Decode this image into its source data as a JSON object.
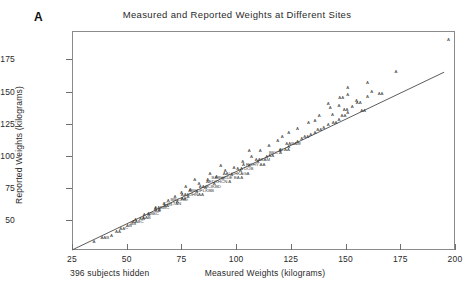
{
  "panel": {
    "label": "A"
  },
  "axes": {
    "ylabel": "Reported Weights (kilograms)",
    "xlabel": "Measured  Weights (kilograms)",
    "yticks": [
      "50",
      "75",
      "100",
      "125",
      "150",
      "175"
    ],
    "xticks": [
      "25",
      "50",
      "75",
      "100",
      "125",
      "150",
      "175",
      "200"
    ]
  },
  "footnote": {
    "text": "396 subjects hidden"
  },
  "chart_data": {
    "type": "scatter",
    "title": "Measured and Reported Weights at Different Sites",
    "xlabel": "Measured  Weights (kilograms)",
    "ylabel": "Reported Weights (kilograms)",
    "xlim": [
      25,
      200
    ],
    "ylim": [
      27,
      197
    ],
    "grid": false,
    "legend": null,
    "marker_symbol": "A",
    "marker_note": "Overplot letter codes: A = 1 observation, B = 2, C = 3",
    "reference_line": {
      "label": "fitted line",
      "x": [
        25,
        195
      ],
      "y": [
        27,
        165
      ]
    },
    "points": [
      {
        "x": 35,
        "y": 33,
        "m": "A"
      },
      {
        "x": 40,
        "y": 36,
        "m": "AAB"
      },
      {
        "x": 43,
        "y": 38,
        "m": "A"
      },
      {
        "x": 46,
        "y": 41,
        "m": "AA"
      },
      {
        "x": 48,
        "y": 43,
        "m": "AA"
      },
      {
        "x": 50,
        "y": 44,
        "m": "C"
      },
      {
        "x": 51,
        "y": 46,
        "m": "AB"
      },
      {
        "x": 53,
        "y": 47,
        "m": "BB"
      },
      {
        "x": 55,
        "y": 49,
        "m": "AABC"
      },
      {
        "x": 57,
        "y": 51,
        "m": "AA"
      },
      {
        "x": 59,
        "y": 52,
        "m": "AAB"
      },
      {
        "x": 60,
        "y": 54,
        "m": "A"
      },
      {
        "x": 62,
        "y": 55,
        "m": "ABBC"
      },
      {
        "x": 64,
        "y": 57,
        "m": "AA"
      },
      {
        "x": 65,
        "y": 58,
        "m": "A"
      },
      {
        "x": 66,
        "y": 60,
        "m": "AABBC"
      },
      {
        "x": 68,
        "y": 61,
        "m": "AA"
      },
      {
        "x": 70,
        "y": 62,
        "m": "C"
      },
      {
        "x": 71,
        "y": 63,
        "m": "COLTAN"
      },
      {
        "x": 73,
        "y": 64,
        "m": "A"
      },
      {
        "x": 74,
        "y": 66,
        "m": "BBCJND"
      },
      {
        "x": 76,
        "y": 67,
        "m": "AA"
      },
      {
        "x": 78,
        "y": 68,
        "m": "A"
      },
      {
        "x": 80,
        "y": 70,
        "m": "AABJHNAA"
      },
      {
        "x": 82,
        "y": 72,
        "m": "A"
      },
      {
        "x": 84,
        "y": 73,
        "m": "ABKDFLKBB"
      },
      {
        "x": 86,
        "y": 75,
        "m": "A"
      },
      {
        "x": 88,
        "y": 76,
        "m": "AAJKJKBD"
      },
      {
        "x": 90,
        "y": 78,
        "m": "A"
      },
      {
        "x": 92,
        "y": 80,
        "m": "AEDXHCN A"
      },
      {
        "x": 94,
        "y": 82,
        "m": "B"
      },
      {
        "x": 96,
        "y": 83,
        "m": "BABHKDE  BA  A"
      },
      {
        "x": 98,
        "y": 85,
        "m": "A"
      },
      {
        "x": 100,
        "y": 86,
        "m": "AALCHKAGA"
      },
      {
        "x": 102,
        "y": 88,
        "m": "A"
      },
      {
        "x": 104,
        "y": 90,
        "m": "A  A    DOB"
      },
      {
        "x": 106,
        "y": 92,
        "m": "A"
      },
      {
        "x": 108,
        "y": 93,
        "m": "A   RGHY  AA"
      },
      {
        "x": 110,
        "y": 95,
        "m": "A"
      },
      {
        "x": 112,
        "y": 97,
        "m": "AABAM"
      },
      {
        "x": 114,
        "y": 99,
        "m": "A"
      },
      {
        "x": 116,
        "y": 100,
        "m": "AA"
      },
      {
        "x": 118,
        "y": 102,
        "m": "BKC A"
      },
      {
        "x": 120,
        "y": 104,
        "m": "A"
      },
      {
        "x": 122,
        "y": 105,
        "m": "ALAA"
      },
      {
        "x": 124,
        "y": 107,
        "m": "A"
      },
      {
        "x": 126,
        "y": 109,
        "m": "AABAM"
      },
      {
        "x": 128,
        "y": 111,
        "m": "A"
      },
      {
        "x": 130,
        "y": 113,
        "m": "A"
      },
      {
        "x": 132,
        "y": 115,
        "m": "AA"
      },
      {
        "x": 134,
        "y": 116,
        "m": "A"
      },
      {
        "x": 136,
        "y": 118,
        "m": "A"
      },
      {
        "x": 138,
        "y": 120,
        "m": "AA"
      },
      {
        "x": 140,
        "y": 122,
        "m": "A"
      },
      {
        "x": 142,
        "y": 124,
        "m": "A"
      },
      {
        "x": 145,
        "y": 126,
        "m": "AA"
      },
      {
        "x": 147,
        "y": 128,
        "m": "A"
      },
      {
        "x": 149,
        "y": 131,
        "m": "AA"
      },
      {
        "x": 151,
        "y": 133,
        "m": "A"
      },
      {
        "x": 143,
        "y": 137,
        "m": "A"
      },
      {
        "x": 147,
        "y": 139,
        "m": "A"
      },
      {
        "x": 150,
        "y": 136,
        "m": "AA"
      },
      {
        "x": 153,
        "y": 138,
        "m": "A"
      },
      {
        "x": 156,
        "y": 141,
        "m": "AA"
      },
      {
        "x": 158,
        "y": 135,
        "m": "AA"
      },
      {
        "x": 160,
        "y": 146,
        "m": "A"
      },
      {
        "x": 138,
        "y": 131,
        "m": "A"
      },
      {
        "x": 133,
        "y": 126,
        "m": "A"
      },
      {
        "x": 128,
        "y": 121,
        "m": "A"
      },
      {
        "x": 124,
        "y": 118,
        "m": "A"
      },
      {
        "x": 119,
        "y": 112,
        "m": "A"
      },
      {
        "x": 115,
        "y": 108,
        "m": "A"
      },
      {
        "x": 111,
        "y": 104,
        "m": "A"
      },
      {
        "x": 107,
        "y": 99,
        "m": "A"
      },
      {
        "x": 103,
        "y": 95,
        "m": "A"
      },
      {
        "x": 99,
        "y": 91,
        "m": "A"
      },
      {
        "x": 95,
        "y": 88,
        "m": "A"
      },
      {
        "x": 91,
        "y": 84,
        "m": "A"
      },
      {
        "x": 87,
        "y": 81,
        "m": "A"
      },
      {
        "x": 83,
        "y": 78,
        "m": "A"
      },
      {
        "x": 79,
        "y": 74,
        "m": "A"
      },
      {
        "x": 75,
        "y": 71,
        "m": "A"
      },
      {
        "x": 72,
        "y": 68,
        "m": "A"
      },
      {
        "x": 69,
        "y": 65,
        "m": "A"
      },
      {
        "x": 67,
        "y": 63,
        "m": "A"
      },
      {
        "x": 63,
        "y": 59,
        "m": "A"
      },
      {
        "x": 58,
        "y": 54,
        "m": "A"
      },
      {
        "x": 54,
        "y": 50,
        "m": "A"
      },
      {
        "x": 197,
        "y": 190,
        "m": "A"
      },
      {
        "x": 173,
        "y": 165,
        "m": "A"
      },
      {
        "x": 162,
        "y": 150,
        "m": "A"
      },
      {
        "x": 166,
        "y": 148,
        "m": "AA"
      },
      {
        "x": 155,
        "y": 143,
        "m": "A"
      },
      {
        "x": 151,
        "y": 147,
        "m": "A"
      },
      {
        "x": 144,
        "y": 132,
        "m": "A"
      },
      {
        "x": 136,
        "y": 127,
        "m": "A"
      },
      {
        "x": 121,
        "y": 115,
        "m": "A"
      },
      {
        "x": 106,
        "y": 104,
        "m": "A"
      },
      {
        "x": 93,
        "y": 92,
        "m": "A"
      },
      {
        "x": 88,
        "y": 86,
        "m": "A"
      },
      {
        "x": 81,
        "y": 81,
        "m": "A"
      },
      {
        "x": 77,
        "y": 76,
        "m": "A"
      },
      {
        "x": 160,
        "y": 157,
        "m": "A"
      },
      {
        "x": 151,
        "y": 153,
        "m": "A"
      },
      {
        "x": 148,
        "y": 145,
        "m": "AA"
      },
      {
        "x": 142,
        "y": 140,
        "m": "A"
      }
    ]
  }
}
